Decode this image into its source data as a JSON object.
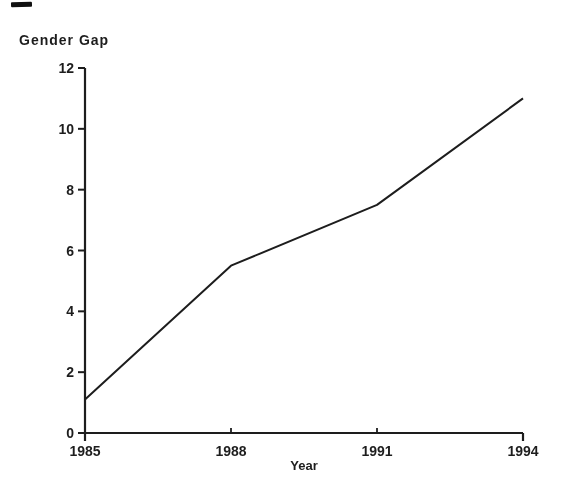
{
  "page": {
    "background": "#ffffff",
    "artifact": "scan-mark-top-left"
  },
  "chart_data": {
    "type": "line",
    "title": "Gender Gap",
    "title_position": "top-left",
    "xlabel": "Year",
    "ylabel": "",
    "x": [
      1985,
      1988,
      1991,
      1994
    ],
    "series": [
      {
        "name": "Gender Gap",
        "values": [
          1.1,
          5.5,
          7.5,
          11
        ]
      }
    ],
    "xticks": [
      "1985",
      "1988",
      "1991",
      "1994"
    ],
    "yticks": [
      0,
      2,
      4,
      6,
      8,
      10,
      12
    ],
    "xlim": [
      1985,
      1994
    ],
    "ylim": [
      0,
      12
    ],
    "grid": false,
    "legend": "none",
    "line_color": "#1d1d1d",
    "axis_color": "#1d1d1d",
    "text_color": "#1d1d1d"
  }
}
